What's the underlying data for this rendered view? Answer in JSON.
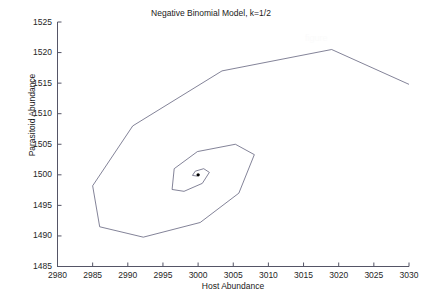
{
  "chart_data": {
    "type": "line",
    "title": "Negative Binomial Model, k=1/2",
    "xlabel": "Host Abundance",
    "ylabel": "Parasitoid Abundance",
    "xlim": [
      2980,
      3030
    ],
    "ylim": [
      1485,
      1525
    ],
    "xticks": [
      2980,
      2985,
      2990,
      2995,
      3000,
      3005,
      3010,
      3015,
      3020,
      3025,
      3030
    ],
    "yticks": [
      1485,
      1490,
      1495,
      1500,
      1505,
      1510,
      1515,
      1520,
      1525
    ],
    "xtick_labels": [
      "2980",
      "2985",
      "2990",
      "2995",
      "3000",
      "3005",
      "3010",
      "3015",
      "3020",
      "3025",
      "3030"
    ],
    "ytick_labels": [
      "1485",
      "1490",
      "1495",
      "1500",
      "1505",
      "1510",
      "1515",
      "1520",
      "1525"
    ],
    "grid": false,
    "legend": null,
    "line_color": "#4d4d6b",
    "marker_color": "#000000",
    "series": [
      {
        "name": "Host-parasitoid trajectory",
        "description": "Damped spiral converging counterclockwise to the equilibrium point",
        "points": [
          [
            3030.0,
            1514.8
          ],
          [
            3019.0,
            1520.5
          ],
          [
            3003.4,
            1517.0
          ],
          [
            2990.7,
            1508.0
          ],
          [
            2985.0,
            1498.2
          ],
          [
            2986.0,
            1491.5
          ],
          [
            2992.2,
            1489.8
          ],
          [
            3000.3,
            1492.2
          ],
          [
            3005.8,
            1497.0
          ],
          [
            3008.0,
            1503.3
          ],
          [
            3005.3,
            1505.0
          ],
          [
            2999.9,
            1503.8
          ],
          [
            2996.6,
            1501.0
          ],
          [
            2996.3,
            1497.6
          ],
          [
            2998.0,
            1497.3
          ],
          [
            3000.6,
            1498.6
          ],
          [
            3001.6,
            1500.4
          ],
          [
            3000.8,
            1501.0
          ],
          [
            2999.6,
            1500.6
          ],
          [
            2999.2,
            1499.9
          ],
          [
            2999.8,
            1499.8
          ],
          [
            3000.2,
            1500.0
          ],
          [
            3000.0,
            1500.0
          ]
        ]
      }
    ],
    "equilibrium_point": {
      "x": 3000,
      "y": 1500,
      "label": "fixed point"
    },
    "watermark_text": "figure"
  },
  "axes": {
    "x_title": "Host Abundance",
    "y_title": "Parasitoid Abundance"
  },
  "title": {
    "text": "Negative Binomial Model, k=1/2"
  }
}
